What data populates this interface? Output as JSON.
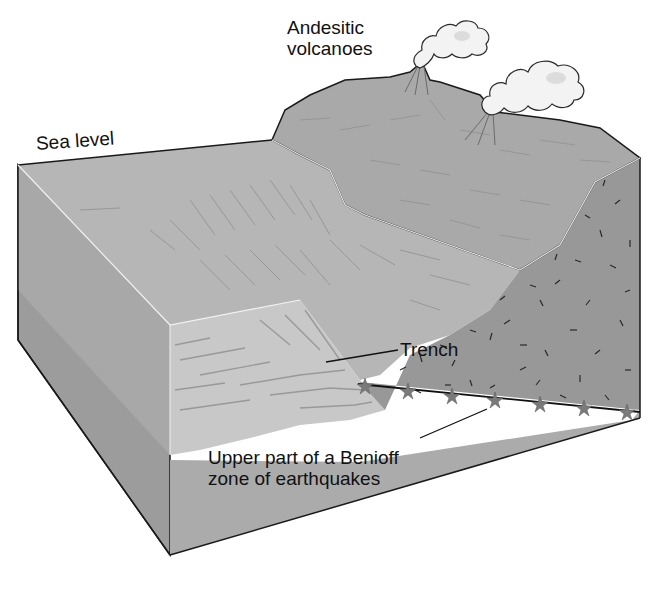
{
  "figure": {
    "type": "block diagram"
  },
  "labels": {
    "sea_level": "Sea level",
    "volcanoes_line1": "Andesitic",
    "volcanoes_line2": "volcanoes",
    "trench": "Trench",
    "benioff_line1": "Upper part of a Benioff",
    "benioff_line2": "zone of earthquakes"
  },
  "features": {
    "volcano_count": 2,
    "earthquake_star_count": 7
  },
  "colors": {
    "ocean_surface": "#b4b4b4",
    "sediment_front": "#c6c6c6",
    "crust_side": "#a2a2a2",
    "continent_surface": "#a8a8a8",
    "continent_side": "#959595",
    "lower_block": "#aaaaaa",
    "star": "#7a7a7a",
    "line": "#1a1a1a",
    "ash_cloud": "#f2f2f2"
  }
}
